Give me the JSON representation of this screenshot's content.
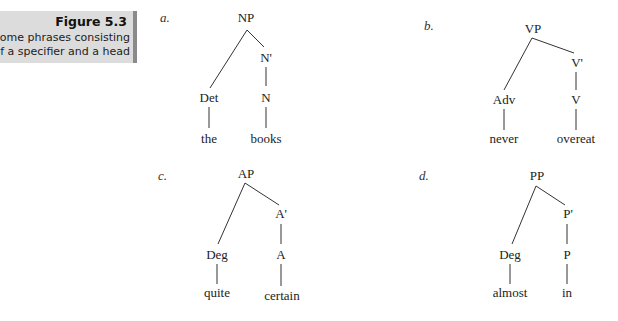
{
  "caption": {
    "title": "Figure 5.3",
    "line1": "Some phrases consisting",
    "line2": "of a specifier and a head",
    "background_color": "#dcdcdc",
    "border_color": "#8a8a8a"
  },
  "trees": [
    {
      "label": "a.",
      "root": "NP",
      "specifier": "Det",
      "intermediate": "N'",
      "head": "N",
      "specifier_word": "the",
      "head_word": "books"
    },
    {
      "label": "b.",
      "root": "VP",
      "specifier": "Adv",
      "intermediate": "V'",
      "head": "V",
      "specifier_word": "never",
      "head_word": "overeat"
    },
    {
      "label": "c.",
      "root": "AP",
      "specifier": "Deg",
      "intermediate": "A'",
      "head": "A",
      "specifier_word": "quite",
      "head_word": "certain"
    },
    {
      "label": "d.",
      "root": "PP",
      "specifier": "Deg",
      "intermediate": "P'",
      "head": "P",
      "specifier_word": "almost",
      "head_word": "in"
    }
  ]
}
